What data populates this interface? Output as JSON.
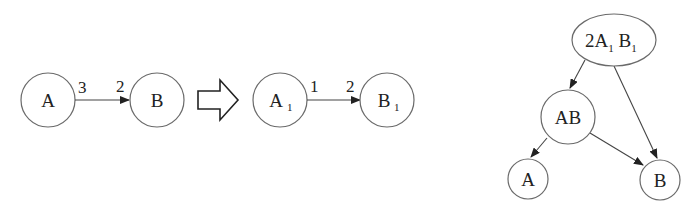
{
  "diagram": {
    "left_graph": {
      "nodes": [
        {
          "id": "A",
          "label": "A"
        },
        {
          "id": "B",
          "label": "B"
        }
      ],
      "edge": {
        "from": "A",
        "to": "B",
        "tail_label": "3",
        "head_label": "2"
      }
    },
    "transform_arrow": {
      "icon": "hollow-right-arrow-icon"
    },
    "middle_graph": {
      "nodes": [
        {
          "id": "A1",
          "label": "A",
          "subscript": "1"
        },
        {
          "id": "B1",
          "label": "B",
          "subscript": "1"
        }
      ],
      "edge": {
        "from": "A1",
        "to": "B1",
        "tail_label": "1",
        "head_label": "2"
      }
    },
    "tree_graph": {
      "root": {
        "label_prefix": "2A",
        "sub1": "1",
        "label_mid": " B",
        "sub2": "1"
      },
      "nodes": [
        {
          "id": "AB",
          "label": "AB"
        },
        {
          "id": "A",
          "label": "A"
        },
        {
          "id": "B",
          "label": "B"
        }
      ],
      "edges": [
        {
          "from": "root",
          "to": "AB"
        },
        {
          "from": "root",
          "to": "B"
        },
        {
          "from": "AB",
          "to": "A"
        },
        {
          "from": "AB",
          "to": "B"
        }
      ]
    }
  }
}
